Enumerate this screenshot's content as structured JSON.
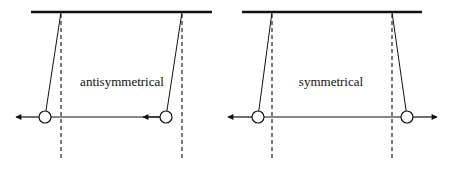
{
  "diagram": {
    "type": "coupled-pendulum-modes",
    "colors": {
      "stroke": "#111111",
      "dash": "#333333",
      "background": "#ffffff"
    },
    "panels": [
      {
        "id": "antisymmetrical",
        "label": "antisymmetrical",
        "label_pos": [
          122,
          86
        ],
        "top_bar": {
          "x1": 31,
          "x2": 212,
          "y": 12
        },
        "rest_lines": [
          61,
          182
        ],
        "rest_bottom": 160,
        "pendulums": [
          {
            "pivot": [
              61,
              12
            ],
            "bob": [
              45,
              117
            ]
          },
          {
            "pivot": [
              182,
              12
            ],
            "bob": [
              166,
              117
            ]
          }
        ],
        "coupling_line": {
          "x1": 45,
          "x2": 166,
          "y": 117
        },
        "arrows": [
          {
            "from": 39,
            "to": 16,
            "y": 117,
            "direction": "left"
          },
          {
            "from": 160,
            "to": 143,
            "y": 117,
            "direction": "left"
          }
        ]
      },
      {
        "id": "symmetrical",
        "label": "symmetrical",
        "label_pos": [
          331,
          86
        ],
        "top_bar": {
          "x1": 242,
          "x2": 422,
          "y": 12
        },
        "rest_lines": [
          272,
          392
        ],
        "rest_bottom": 160,
        "pendulums": [
          {
            "pivot": [
              272,
              12
            ],
            "bob": [
              258,
              117
            ]
          },
          {
            "pivot": [
              392,
              12
            ],
            "bob": [
              407,
              117
            ]
          }
        ],
        "coupling_line": {
          "x1": 258,
          "x2": 407,
          "y": 117
        },
        "arrows": [
          {
            "from": 252,
            "to": 228,
            "y": 117,
            "direction": "left"
          },
          {
            "from": 413,
            "to": 437,
            "y": 117,
            "direction": "right"
          }
        ]
      }
    ],
    "bob_radius": 6
  }
}
